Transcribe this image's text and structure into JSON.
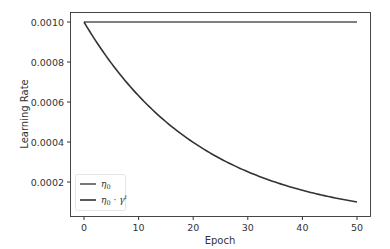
{
  "chart_data": {
    "type": "line",
    "title": "",
    "xlabel": "Epoch",
    "ylabel": "Learning Rate",
    "xlim": [
      -3,
      53
    ],
    "ylim": [
      7e-05,
      0.00103
    ],
    "xticks": [
      0,
      10,
      20,
      30,
      40,
      50
    ],
    "xtick_labels": [
      "0",
      "10",
      "20",
      "30",
      "40",
      "50"
    ],
    "yticks": [
      0.0002,
      0.0004,
      0.0006,
      0.0008,
      0.001
    ],
    "ytick_labels": [
      "0.0002",
      "0.0004",
      "0.0006",
      "0.0008",
      "0.0010"
    ],
    "grid": false,
    "legend_position": "lower left",
    "series": [
      {
        "name": "η₀",
        "legend_label": "η0",
        "color": "#555555",
        "x": [
          0,
          50
        ],
        "values": [
          0.001,
          0.001
        ]
      },
      {
        "name": "η₀ · γᵗ",
        "legend_label": "η0 · γt",
        "color": "#333333",
        "gamma": 0.955,
        "x": [
          0,
          5,
          10,
          15,
          20,
          25,
          30,
          35,
          40,
          45,
          50
        ],
        "values": [
          0.001,
          0.000794,
          0.000631,
          0.000501,
          0.000398,
          0.000316,
          0.000251,
          0.0002,
          0.000158,
          0.000126,
          0.0001
        ]
      }
    ]
  }
}
